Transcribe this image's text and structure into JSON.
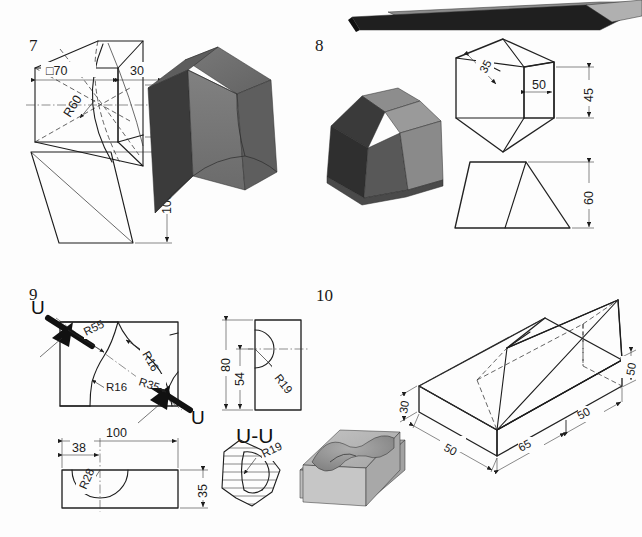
{
  "sheet": {
    "title": "Technical drawing exercise sheet — descriptive geometry problems 7 to 10",
    "background_color": "#fdfdfd",
    "line_color": "#1d1d1d",
    "width": 642,
    "height": 537
  },
  "figures": [
    {
      "id": "figure-7",
      "number": "7",
      "description": "Truncated pyramid-like prism with curved (cylindrical) cut, front view and side view plus shaded isometric solid",
      "dimensions": [
        {
          "name": "square-70",
          "label": "□70"
        },
        {
          "name": "width-30",
          "label": "30"
        },
        {
          "name": "radius-60",
          "label": "R60"
        },
        {
          "name": "height-30",
          "label": "30"
        },
        {
          "name": "height-100",
          "label": "100"
        }
      ],
      "solid": {
        "name": "shaded-solid-7",
        "top_face_color": "#6e6e6e",
        "left_face_color": "#3b3b3b",
        "front_face_color": "#777777",
        "right_face_color": "#5a5a5a"
      }
    },
    {
      "id": "figure-8",
      "number": "8",
      "description": "Faceted wedge prism with hexagonal top view and trapezoid-triangle front view plus shaded isometric solid",
      "dimensions": [
        {
          "name": "depth-35",
          "label": "35"
        },
        {
          "name": "width-50",
          "label": "50"
        },
        {
          "name": "height-45",
          "label": "45"
        },
        {
          "name": "height-60",
          "label": "60"
        }
      ],
      "solid": {
        "name": "shaded-solid-8",
        "top_face_color": "#8d8d8d",
        "left_face_color": "#3a3a3a",
        "center_face_color": "#585858",
        "right_face_color": "#8a8a8a"
      }
    },
    {
      "id": "figure-9",
      "number": "9",
      "description": "Rectangular block with S-shaped curved groove; top view with section arrows U-U, side view, bottom view, section view and shaded solid",
      "dimensions": [
        {
          "name": "radius-55",
          "label": "R55"
        },
        {
          "name": "radius-16-upper",
          "label": "R16"
        },
        {
          "name": "radius-16-lower",
          "label": "R16"
        },
        {
          "name": "radius-35",
          "label": "R35"
        },
        {
          "name": "length-100",
          "label": "100"
        },
        {
          "name": "offset-38",
          "label": "38"
        },
        {
          "name": "radius-28",
          "label": "R28"
        },
        {
          "name": "height-35",
          "label": "35"
        },
        {
          "name": "height-80",
          "label": "80"
        },
        {
          "name": "height-54",
          "label": "54"
        },
        {
          "name": "radius-19-side",
          "label": "R19"
        },
        {
          "name": "radius-19-section",
          "label": "R19"
        }
      ],
      "section_marks": {
        "arrow_left_label": "U",
        "arrow_right_label": "U",
        "section_title": "U-U"
      },
      "solid": {
        "name": "shaded-solid-9",
        "top_face_color": "#a8a8a8",
        "cavity_color": "#8f8f8f",
        "front_face_color": "#b4b4b4",
        "side_face_color": "#9a9a9a"
      }
    },
    {
      "id": "figure-10",
      "number": "10",
      "description": "Isometric wireframe of a rectangular base block with pyramidal wedge on top, with hidden lines; plus shaded solid with double-curved pocket",
      "dimensions": [
        {
          "name": "height-30",
          "label": "30"
        },
        {
          "name": "depth-50-left",
          "label": "50"
        },
        {
          "name": "length-65",
          "label": "65"
        },
        {
          "name": "length-50-right",
          "label": "50"
        },
        {
          "name": "height-50-vertical",
          "label": "50"
        }
      ],
      "solid": {
        "name": "shaded-solid-10",
        "top_face_color": "#b6b6b6",
        "cavity_color": "#9b9b9b",
        "front_face_color": "#c2c2c2",
        "side_face_color": "#a5a5a5"
      }
    }
  ],
  "top_artifact": {
    "name": "cropped-dark-solid",
    "description": "Dark elongated 3D bar partially cut off at the top edge of the sheet",
    "dark_color": "#1f1f1f",
    "mid_color": "#8c8c8c",
    "light_color": "#b0b0b0"
  }
}
